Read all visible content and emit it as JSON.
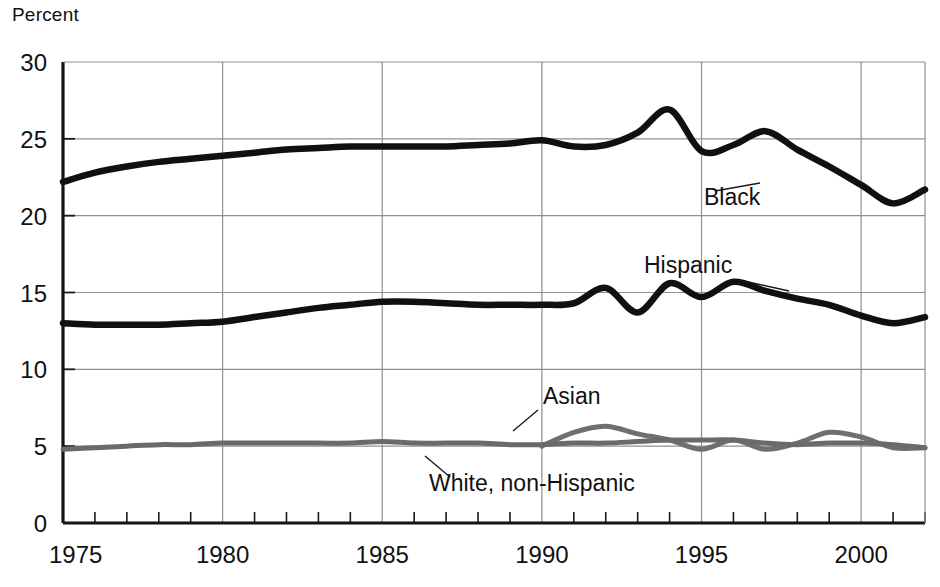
{
  "chart_data": {
    "type": "line",
    "title": "",
    "ylabel": "Percent",
    "xlabel": "",
    "xlim": [
      1975,
      2002
    ],
    "ylim": [
      0,
      30
    ],
    "ytick_labels": [
      "0",
      "5",
      "10",
      "15",
      "20",
      "25",
      "30"
    ],
    "yticks": [
      0,
      5,
      10,
      15,
      20,
      25,
      30
    ],
    "xtick_labels": [
      "1975",
      "1980",
      "1985",
      "1990",
      "1995",
      "2000"
    ],
    "xticks": [
      1975,
      1980,
      1985,
      1990,
      1995,
      2000
    ],
    "minor_xticks_every": 1,
    "grid": "both-major",
    "legend_position": "inline-annotations",
    "series": [
      {
        "name": "Black",
        "color": "#101010",
        "label_text": "Black",
        "x": [
          1975,
          1976,
          1977,
          1978,
          1979,
          1980,
          1981,
          1982,
          1983,
          1984,
          1985,
          1986,
          1987,
          1988,
          1989,
          1990,
          1991,
          1992,
          1993,
          1994,
          1995,
          1996,
          1997,
          1998,
          1999,
          2000,
          2001,
          2002
        ],
        "values": [
          22.2,
          22.8,
          23.2,
          23.5,
          23.7,
          23.9,
          24.1,
          24.3,
          24.4,
          24.5,
          24.5,
          24.5,
          24.5,
          24.6,
          24.7,
          24.9,
          24.5,
          24.6,
          25.4,
          26.9,
          24.2,
          24.6,
          25.5,
          24.3,
          23.2,
          22.0,
          20.8,
          21.7
        ]
      },
      {
        "name": "Hispanic",
        "color": "#101010",
        "label_text": "Hispanic",
        "x": [
          1975,
          1976,
          1977,
          1978,
          1979,
          1980,
          1981,
          1982,
          1983,
          1984,
          1985,
          1986,
          1987,
          1988,
          1989,
          1990,
          1991,
          1992,
          1993,
          1994,
          1995,
          1996,
          1997,
          1998,
          1999,
          2000,
          2001,
          2002
        ],
        "values": [
          13.0,
          12.9,
          12.9,
          12.9,
          13.0,
          13.1,
          13.4,
          13.7,
          14.0,
          14.2,
          14.4,
          14.4,
          14.3,
          14.2,
          14.2,
          14.2,
          14.3,
          15.3,
          13.7,
          15.6,
          14.7,
          15.7,
          15.1,
          14.6,
          14.2,
          13.5,
          13.0,
          13.4
        ]
      },
      {
        "name": "Asian",
        "color": "#6f6f6f",
        "label_text": "Asian",
        "x": [
          1990,
          1991,
          1992,
          1993,
          1994,
          1995,
          1996,
          1997,
          1998,
          1999,
          2000,
          2001,
          2002
        ],
        "values": [
          5.0,
          5.9,
          6.3,
          5.8,
          5.4,
          4.8,
          5.4,
          4.8,
          5.2,
          5.9,
          5.6,
          4.9,
          4.9
        ]
      },
      {
        "name": "White, non-Hispanic",
        "color": "#6a6a6a",
        "label_text": "White, non-Hispanic",
        "x": [
          1975,
          1976,
          1977,
          1978,
          1979,
          1980,
          1981,
          1982,
          1983,
          1984,
          1985,
          1986,
          1987,
          1988,
          1989,
          1990,
          1991,
          1992,
          1993,
          1994,
          1995,
          1996,
          1997,
          1998,
          1999,
          2000,
          2001,
          2002
        ],
        "values": [
          4.8,
          4.9,
          5.0,
          5.1,
          5.1,
          5.2,
          5.2,
          5.2,
          5.2,
          5.2,
          5.3,
          5.2,
          5.2,
          5.2,
          5.1,
          5.1,
          5.2,
          5.2,
          5.3,
          5.4,
          5.4,
          5.4,
          5.2,
          5.1,
          5.2,
          5.2,
          5.1,
          4.9
        ]
      }
    ],
    "annotations": [
      {
        "text": "Black",
        "x": 704,
        "y": 205,
        "leader": [
          [
            760,
            183
          ],
          [
            715,
            191
          ]
        ]
      },
      {
        "text": "Hispanic",
        "x": 644,
        "y": 273,
        "leader": [
          [
            789,
            291
          ],
          [
            744,
            281
          ]
        ]
      },
      {
        "text": "Asian",
        "x": 543,
        "y": 404,
        "leader": [
          [
            513,
            431
          ],
          [
            538,
            410
          ]
        ]
      },
      {
        "text": "White, non-Hispanic",
        "x": 429,
        "y": 491,
        "leader": [
          [
            425,
            456
          ],
          [
            450,
            477
          ]
        ]
      }
    ]
  }
}
